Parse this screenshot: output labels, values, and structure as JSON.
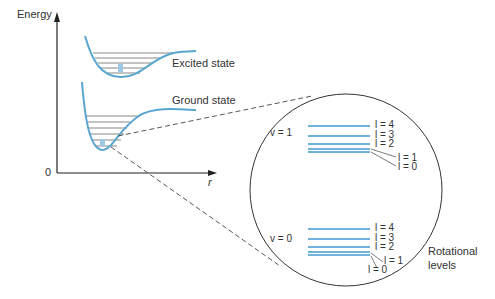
{
  "axes": {
    "y_label": "Energy",
    "x_label": "r",
    "origin_label": "0"
  },
  "curves": {
    "excited_label": "Excited state",
    "ground_label": "Ground state"
  },
  "zoom_circle": {
    "v1": {
      "label": "v = 1",
      "levels": [
        "l = 4",
        "l = 3",
        "l = 2",
        "l = 1",
        "l = 0"
      ]
    },
    "v0": {
      "label": "v = 0",
      "levels": [
        "l = 4",
        "l = 3",
        "l = 2",
        "l = 1",
        "l = 0"
      ]
    },
    "rotational_label_line1": "Rotational",
    "rotational_label_line2": "levels"
  },
  "colors": {
    "curve": "#5aa6cf",
    "level_line": "#6fb3db",
    "text": "#333333"
  }
}
